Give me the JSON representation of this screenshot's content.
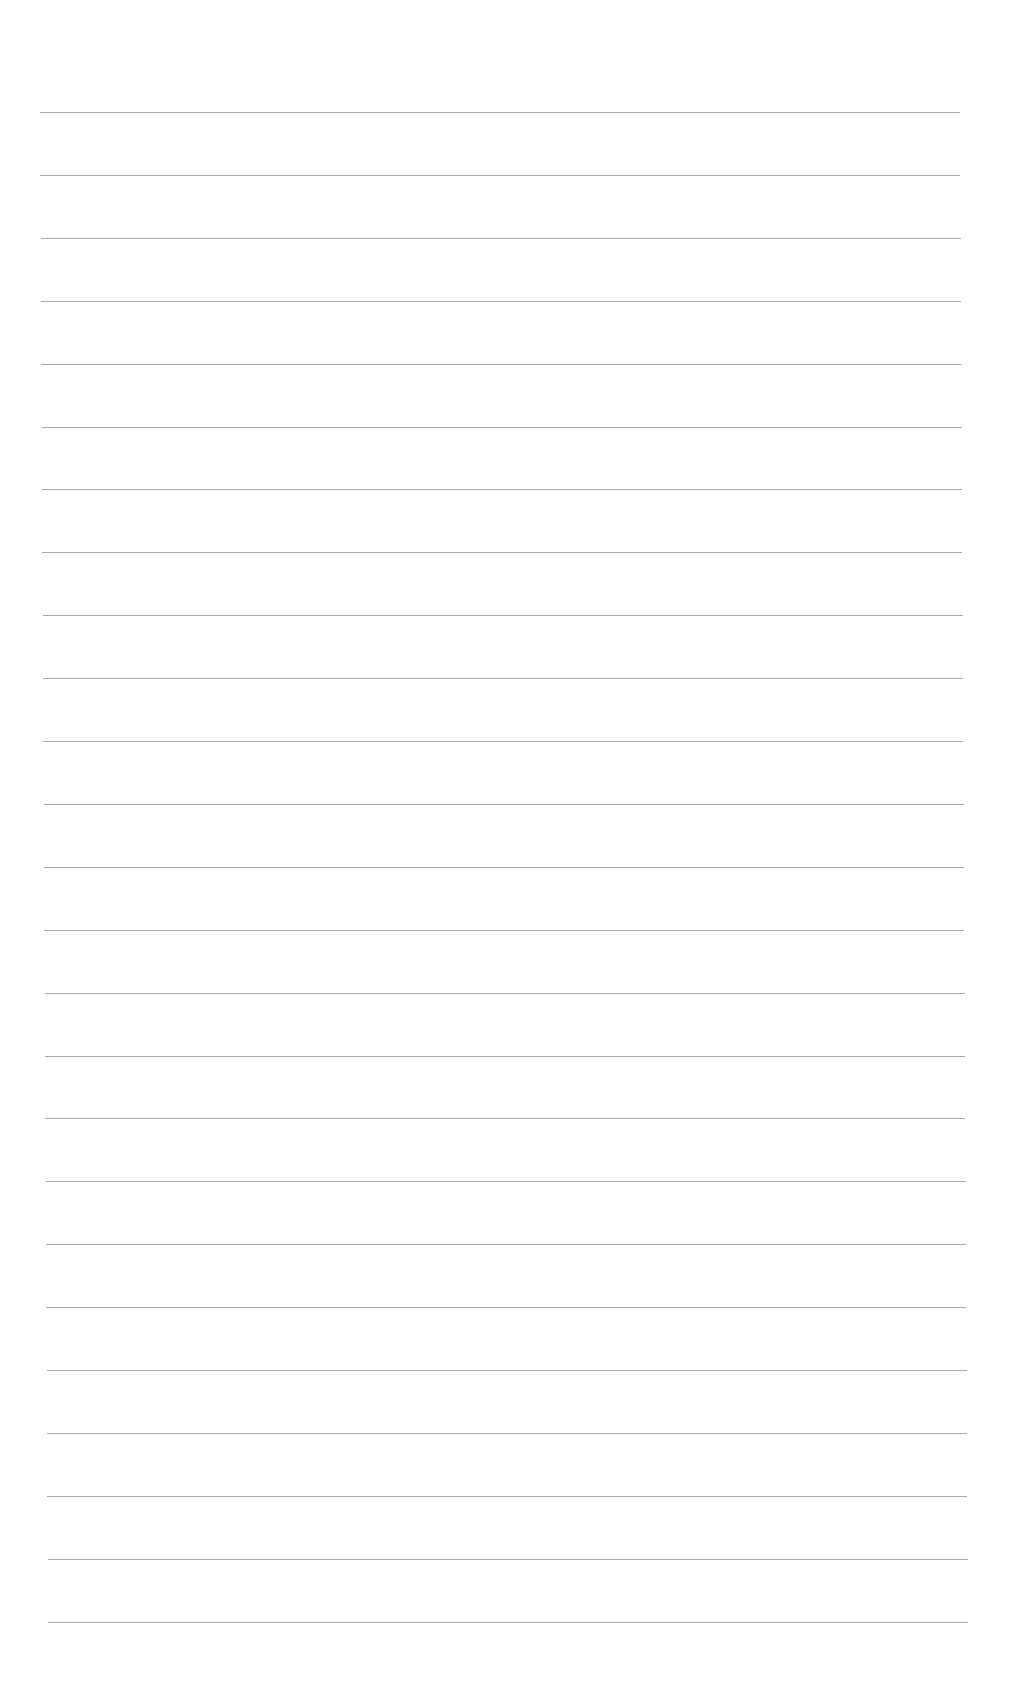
{
  "page": {
    "type": "lined-paper",
    "background": "#ffffff",
    "line_color": "#9a9a9a",
    "line_count": 25,
    "first_line_y": 112,
    "line_spacing": 62.9,
    "line_left_start": 40,
    "line_left_end": 48,
    "line_right_start": 960,
    "line_right_end": 968
  }
}
